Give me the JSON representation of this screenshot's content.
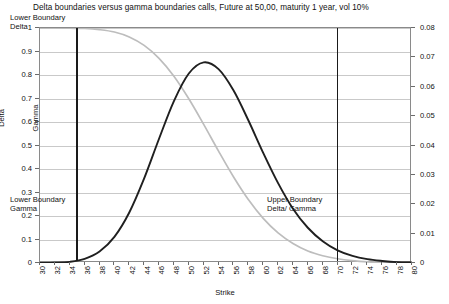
{
  "chart_data": {
    "type": "line",
    "title": "Delta boundaries versus gamma boundaries calls, Future at 50,00, maturity 1 year, vol 10%",
    "xlabel": "Strike",
    "ylabel": "Delta",
    "y2label": "Gamma",
    "xlim": [
      30,
      80
    ],
    "ylim": [
      0,
      1
    ],
    "y2lim": [
      0,
      0.08
    ],
    "grid": true,
    "legend": "none",
    "x_ticks": [
      "30",
      "32",
      "34",
      "36",
      "38",
      "40",
      "42",
      "44",
      "46",
      "48",
      "50",
      "52",
      "54",
      "56",
      "58",
      "60",
      "62",
      "64",
      "66",
      "68",
      "70",
      "72",
      "74",
      "76",
      "78",
      "80"
    ],
    "y_left_ticks": [
      "0",
      "0.1",
      "0.2",
      "0.3",
      "0.4",
      "0.5",
      "0.6",
      "0.7",
      "0.8",
      "0.9",
      "1"
    ],
    "y_right_ticks": [
      "0",
      "0.01",
      "0.02",
      "0.03",
      "0.04",
      "0.05",
      "0.06",
      "0.07",
      "0.08"
    ],
    "series": [
      {
        "name": "Delta",
        "axis": "left",
        "color": "#bdbdbd",
        "x": [
          30,
          32,
          34,
          36,
          38,
          40,
          42,
          44,
          46,
          48,
          50,
          52,
          54,
          56,
          58,
          60,
          62,
          64,
          66,
          68,
          70,
          72,
          74,
          76,
          78,
          80
        ],
        "values": [
          1.0,
          1.0,
          0.999,
          0.998,
          0.993,
          0.983,
          0.962,
          0.926,
          0.871,
          0.795,
          0.699,
          0.59,
          0.476,
          0.367,
          0.27,
          0.19,
          0.128,
          0.083,
          0.051,
          0.031,
          0.018,
          0.01,
          0.005,
          0.003,
          0.001,
          0.001
        ]
      },
      {
        "name": "Gamma",
        "axis": "right",
        "color": "#1f1f1f",
        "x": [
          30,
          32,
          34,
          36,
          38,
          40,
          42,
          44,
          46,
          48,
          50,
          52,
          54,
          56,
          58,
          60,
          62,
          64,
          66,
          68,
          70,
          72,
          74,
          76,
          78,
          80
        ],
        "values": [
          0.0,
          0.0001,
          0.0004,
          0.0014,
          0.0039,
          0.0089,
          0.0172,
          0.0288,
          0.0423,
          0.0551,
          0.0645,
          0.0683,
          0.066,
          0.0588,
          0.0486,
          0.0375,
          0.0272,
          0.0185,
          0.012,
          0.0074,
          0.0043,
          0.0024,
          0.0013,
          0.0007,
          0.0003,
          0.0002
        ]
      }
    ],
    "annotations": [
      {
        "name": "lower-boundary-delta",
        "line1": "Lower Boundary",
        "line2": "Delta",
        "x_value": 35
      },
      {
        "name": "lower-boundary-gamma",
        "line1": "Lower Boundary",
        "line2": "Gamma",
        "x_value": 35
      },
      {
        "name": "upper-boundary-delta-gamma",
        "line1": "Upper Boundary",
        "line2": "Delta/ Gamma",
        "x_value": 70
      }
    ],
    "boundary_lines": [
      {
        "name": "lower-boundary",
        "x_value": 35,
        "color": "#1a1a1a"
      },
      {
        "name": "upper-boundary",
        "x_value": 70,
        "color": "#1a1a1a"
      }
    ]
  }
}
